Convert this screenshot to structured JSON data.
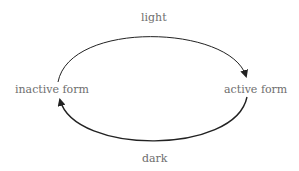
{
  "diagram": {
    "nodes": [
      {
        "id": "inactive",
        "label": "inactive form"
      },
      {
        "id": "active",
        "label": "active form"
      }
    ],
    "edges": [
      {
        "from": "inactive",
        "to": "active",
        "label": "light"
      },
      {
        "from": "active",
        "to": "inactive",
        "label": "dark"
      }
    ],
    "colors": {
      "text": "#6e6e6e",
      "arrow": "#222222"
    }
  }
}
